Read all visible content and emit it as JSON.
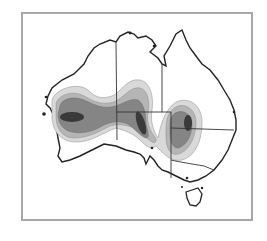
{
  "map": {
    "subject": "Australia",
    "style": "grayscale density contour map",
    "frame_color": "#a8a8a8",
    "coastline_color": "#222222",
    "border_color": "#333333",
    "contour_levels": [
      {
        "level": 1,
        "fill": "#d9d9d9"
      },
      {
        "level": 2,
        "fill": "#b5b5b5"
      },
      {
        "level": 3,
        "fill": "#858585"
      },
      {
        "level": 4,
        "fill": "#3a3a3a"
      }
    ],
    "hotspots": [
      {
        "name": "western-australia-hotspot"
      },
      {
        "name": "south-australia-hotspot"
      },
      {
        "name": "queensland-nsw-hotspot"
      }
    ],
    "regions": [
      "Western Australia",
      "Northern Territory",
      "South Australia",
      "Queensland",
      "New South Wales",
      "Victoria",
      "Tasmania"
    ]
  }
}
